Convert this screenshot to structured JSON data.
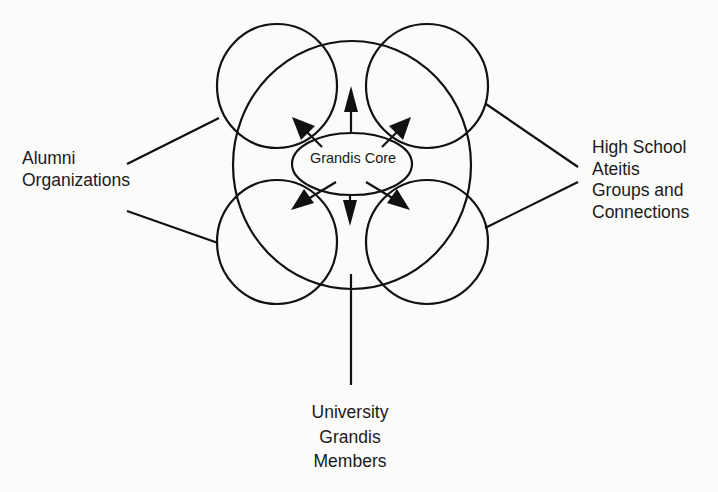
{
  "diagram": {
    "core": {
      "label": "Grandis Core"
    },
    "labels": {
      "left": {
        "lines": [
          "Alumni",
          "Organizations"
        ]
      },
      "right": {
        "lines": [
          "High School",
          "Ateitis",
          "Groups and",
          "Connections"
        ]
      },
      "bottom": {
        "lines": [
          "University",
          "Grandis",
          "Members"
        ]
      }
    },
    "colors": {
      "stroke": "#111111",
      "background": "#fbfbfa"
    },
    "shapes": {
      "outer_ellipse": {
        "cx": 352,
        "cy": 165,
        "rx": 119,
        "ry": 124
      },
      "core_ellipse": {
        "cx": 352,
        "cy": 164,
        "rx": 60,
        "ry": 31
      },
      "satellite_circles": [
        {
          "name": "top-left",
          "cx": 277,
          "cy": 86,
          "rx": 60,
          "ry": 62
        },
        {
          "name": "top-right",
          "cx": 427,
          "cy": 86,
          "rx": 61,
          "ry": 62
        },
        {
          "name": "bottom-left",
          "cx": 277,
          "cy": 242,
          "rx": 60,
          "ry": 62
        },
        {
          "name": "bottom-right",
          "cx": 427,
          "cy": 242,
          "rx": 61,
          "ry": 62
        }
      ],
      "arrows": [
        "up",
        "up-left",
        "up-right",
        "down",
        "down-left",
        "down-right"
      ]
    }
  }
}
